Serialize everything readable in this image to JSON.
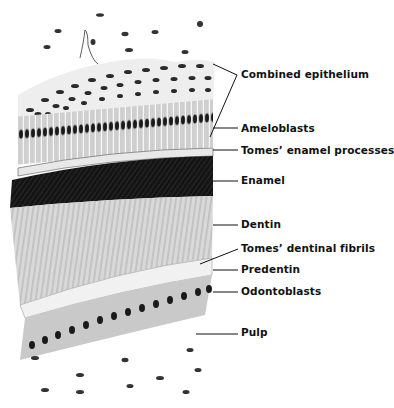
{
  "figure": {
    "labels": [
      {
        "id": "combined-epithelium",
        "text": "Combined epithelium",
        "x": 241,
        "y": 68
      },
      {
        "id": "ameloblasts",
        "text": "Ameloblasts",
        "x": 241,
        "y": 122
      },
      {
        "id": "tomes-enamel-processes",
        "text": "Tomes’ enamel processes",
        "x": 241,
        "y": 144
      },
      {
        "id": "enamel",
        "text": "Enamel",
        "x": 241,
        "y": 174
      },
      {
        "id": "dentin",
        "text": "Dentin",
        "x": 241,
        "y": 218
      },
      {
        "id": "tomes-dentinal-fibrils",
        "text": "Tomes’ dentinal fibrils",
        "x": 241,
        "y": 242
      },
      {
        "id": "predentin",
        "text": "Predentin",
        "x": 241,
        "y": 263
      },
      {
        "id": "odontoblasts",
        "text": "Odontoblasts",
        "x": 241,
        "y": 285
      },
      {
        "id": "pulp",
        "text": "Pulp",
        "x": 241,
        "y": 326
      }
    ],
    "colors": {
      "ink": "#111111",
      "background": "#ffffff",
      "enamel": "#141414"
    }
  }
}
